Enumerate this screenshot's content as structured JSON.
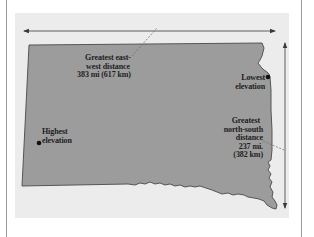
{
  "diagram": {
    "colors": {
      "background": "#ffffff",
      "panel": "#ececec",
      "state_fill": "#9c9c9c",
      "state_stroke": "#4a4a4a",
      "arrow": "#3a3a3a",
      "leader": "#6a6a6a",
      "marker": "#111111",
      "text": "#1e1e1e",
      "frame": "#9a9a9a"
    },
    "labels": {
      "east_west": {
        "line1": "Greatest east-",
        "line2": "west distance",
        "line3": "383 mi (617 km)"
      },
      "lowest_elevation": {
        "line1": "Lowest",
        "line2": "elevation"
      },
      "highest_elevation": {
        "line1": "Highest",
        "line2": "elevation"
      },
      "north_south": {
        "line1": "Greatest",
        "line2": "north-south",
        "line3": "distance",
        "line4": "237 mi.",
        "line5": "(382 km)"
      }
    },
    "arrows": [
      {
        "name": "east-west",
        "direction": "horizontal",
        "value": "383 mi (617 km)"
      },
      {
        "name": "north-south",
        "direction": "vertical",
        "value": "237 mi. (382 km)"
      }
    ],
    "markers": [
      {
        "name": "lowest-elevation",
        "position": "east border"
      },
      {
        "name": "highest-elevation",
        "position": "west"
      }
    ]
  }
}
